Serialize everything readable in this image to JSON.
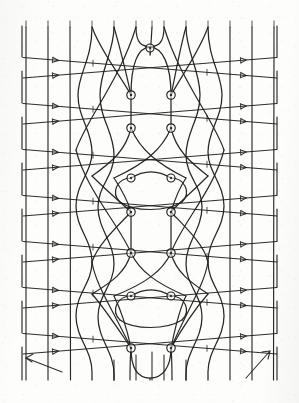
{
  "figure": {
    "kind": "knot-braid-diagram",
    "background_color": "#fdfdfb",
    "ink_color": "#1d1d1d",
    "width": 299,
    "height": 403
  },
  "geometry": {
    "plot_left": 22,
    "plot_right": 278,
    "plot_top": 24,
    "plot_bottom": 382,
    "vertical_strand_x": [
      25,
      47,
      70,
      92,
      114,
      136,
      152,
      164,
      186,
      208,
      230,
      252,
      274
    ],
    "weaving_strand_x": [
      92,
      114,
      136,
      152,
      164,
      186,
      208
    ],
    "band_y": [
      58,
      70,
      104,
      116,
      150,
      162,
      196,
      208,
      242,
      254,
      288,
      300,
      334,
      346
    ],
    "diagonal_slope_down": 0.082,
    "diagonal_slope_up": -0.082,
    "apex_x": 150
  },
  "elements": {
    "vertical_strand": "vertical-strand",
    "descending_diagonal": "descending-diagonal-line",
    "ascending_diagonal": "ascending-diagonal-line",
    "weaving_curve": "weaving-curve-strand",
    "crossing_node": "crossing-node-circle",
    "arrow_marker": "arrow-marker",
    "tick_marker": "tick-marker",
    "corner_arrow": "corner-orientation-arrow",
    "frame_edge": "frame-edge-line"
  },
  "crossing_nodes": [
    {
      "id": "n1",
      "x": 150,
      "y": 48,
      "r": 4.0
    },
    {
      "id": "n2",
      "x": 131,
      "y": 95,
      "r": 4.2
    },
    {
      "id": "n3",
      "x": 171,
      "y": 95,
      "r": 4.2
    },
    {
      "id": "n4",
      "x": 131,
      "y": 128,
      "r": 4.2
    },
    {
      "id": "n5",
      "x": 171,
      "y": 128,
      "r": 4.2
    },
    {
      "id": "n6",
      "x": 131,
      "y": 178,
      "r": 4.0
    },
    {
      "id": "n7",
      "x": 171,
      "y": 178,
      "r": 4.0
    },
    {
      "id": "n8",
      "x": 131,
      "y": 212,
      "r": 4.2
    },
    {
      "id": "n9",
      "x": 171,
      "y": 212,
      "r": 4.2
    },
    {
      "id": "n10",
      "x": 131,
      "y": 253,
      "r": 4.2
    },
    {
      "id": "n11",
      "x": 171,
      "y": 253,
      "r": 4.2
    },
    {
      "id": "n12",
      "x": 131,
      "y": 296,
      "r": 4.0
    },
    {
      "id": "n13",
      "x": 171,
      "y": 296,
      "r": 4.0
    },
    {
      "id": "n14",
      "x": 131,
      "y": 348,
      "r": 4.2
    },
    {
      "id": "n15",
      "x": 171,
      "y": 348,
      "r": 4.2
    }
  ],
  "counts": {
    "vertical_strands": 13,
    "diagonal_bands": 14,
    "crossing_nodes": 15,
    "weaving_strands": 8,
    "corner_arrows": 2
  },
  "corner_arrows": [
    {
      "id": "bottom-left-arrow",
      "x1": 24,
      "y1": 358,
      "x2": 62,
      "y2": 372,
      "dir": "left"
    },
    {
      "id": "bottom-right-arrow",
      "x1": 268,
      "y1": 352,
      "x2": 246,
      "y2": 378,
      "dir": "up-right"
    }
  ],
  "labels": {
    "none_visible": ""
  }
}
